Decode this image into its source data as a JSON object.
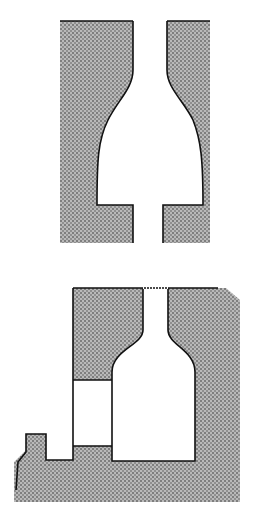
{
  "diagram": {
    "type": "cross-section illustration",
    "figures": [
      {
        "id": "top",
        "description": "Bottle-shaped cavity in stippled mold with narrow neck openings top and bottom"
      },
      {
        "id": "bottom",
        "description": "Bottle-shaped cavity with open neck at top, adjacent rectangular void and small step on left"
      }
    ],
    "colors": {
      "fill": "#8a8a8a",
      "stipple_dark": "#333333",
      "outline": "#111111",
      "background": "#ffffff"
    }
  }
}
